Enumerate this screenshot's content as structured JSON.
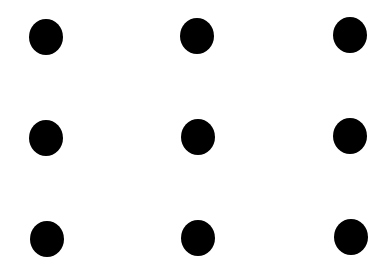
{
  "figure": {
    "type": "nine-dots-grid",
    "rows": 3,
    "cols": 3,
    "background_color": "#ffffff",
    "dot_color": "#000000",
    "dot_width": 34,
    "dot_height": 36,
    "dots": [
      {
        "row": 0,
        "col": 0,
        "cx": 46,
        "cy": 37
      },
      {
        "row": 0,
        "col": 1,
        "cx": 197,
        "cy": 36
      },
      {
        "row": 0,
        "col": 2,
        "cx": 350,
        "cy": 35
      },
      {
        "row": 1,
        "col": 0,
        "cx": 46,
        "cy": 138
      },
      {
        "row": 1,
        "col": 1,
        "cx": 198,
        "cy": 137
      },
      {
        "row": 1,
        "col": 2,
        "cx": 350,
        "cy": 136
      },
      {
        "row": 2,
        "col": 0,
        "cx": 47,
        "cy": 239
      },
      {
        "row": 2,
        "col": 1,
        "cx": 198,
        "cy": 238
      },
      {
        "row": 2,
        "col": 2,
        "cx": 351,
        "cy": 237
      }
    ]
  }
}
